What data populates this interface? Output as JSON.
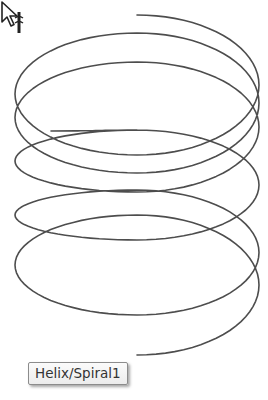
{
  "viewport": {
    "background": "#ffffff",
    "curve_color": "#3a3a3a"
  },
  "helix": {
    "name": "Helix/Spiral1",
    "center_x": 137,
    "radius_x": 122,
    "start_point": [
      51,
      131
    ],
    "keypoints_y": {
      "backs": [
        15,
        33,
        62,
        130,
        190,
        215
      ],
      "fronts": [
        155,
        173,
        192,
        240,
        315,
        355
      ]
    }
  },
  "cursor": {
    "icon": "arrow-pointer-with-helix-icon",
    "x": 24,
    "y": 333
  },
  "tooltip": {
    "text": "Helix/Spiral1"
  }
}
